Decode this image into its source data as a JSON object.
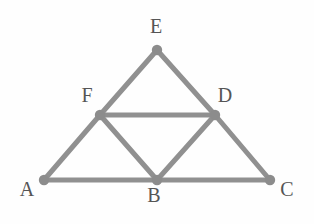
{
  "figure": {
    "background_color": "#fefefe",
    "stroke_color": "#909090",
    "vertex_color": "#8c8c8c",
    "label_color": "#555555",
    "stroke_width": 5,
    "vertex_radius": 5.2,
    "label_font_size": 20,
    "canvas": {
      "width": 314,
      "height": 224
    }
  },
  "chart_data": {
    "type": "diagram",
    "xlim": [
      0,
      314
    ],
    "ylim": [
      0,
      224
    ],
    "grid": false,
    "legend": null,
    "points": [
      {
        "id": "A",
        "label": "A",
        "x": 44,
        "y": 180,
        "label_x": 27,
        "label_y": 191
      },
      {
        "id": "B",
        "label": "B",
        "x": 157,
        "y": 180,
        "label_x": 154,
        "label_y": 197
      },
      {
        "id": "C",
        "label": "C",
        "x": 270,
        "y": 180,
        "label_x": 287,
        "label_y": 191
      },
      {
        "id": "D",
        "label": "D",
        "x": 215,
        "y": 115,
        "label_x": 225,
        "label_y": 97
      },
      {
        "id": "E",
        "label": "E",
        "x": 157,
        "y": 50,
        "label_x": 156,
        "label_y": 28
      },
      {
        "id": "F",
        "label": "F",
        "x": 100,
        "y": 115,
        "label_x": 87,
        "label_y": 97
      }
    ],
    "edges": [
      {
        "from": "A",
        "to": "B"
      },
      {
        "from": "B",
        "to": "C"
      },
      {
        "from": "A",
        "to": "F"
      },
      {
        "from": "F",
        "to": "E"
      },
      {
        "from": "E",
        "to": "D"
      },
      {
        "from": "D",
        "to": "C"
      },
      {
        "from": "F",
        "to": "D"
      },
      {
        "from": "F",
        "to": "B"
      },
      {
        "from": "B",
        "to": "D"
      }
    ]
  }
}
